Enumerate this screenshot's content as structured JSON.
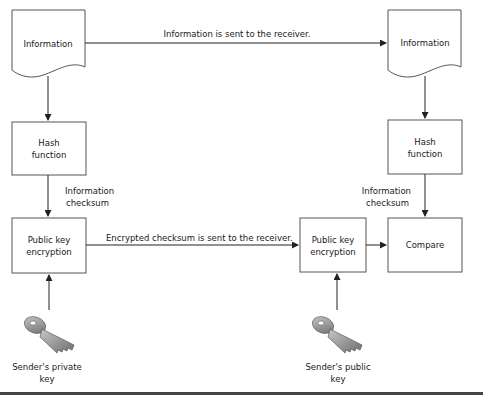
{
  "diagram": {
    "nodes": {
      "info_left": "Information",
      "info_right": "Information",
      "hash_left": [
        "Hash",
        "function"
      ],
      "hash_right": [
        "Hash",
        "function"
      ],
      "pk_left": [
        "Public key",
        "encryption"
      ],
      "pk_right": [
        "Public key",
        "encryption"
      ],
      "compare": "Compare"
    },
    "edges": {
      "info_sent": "Information is sent to the receiver.",
      "checksum_sent": "Encrypted checksum is sent to the receiver.",
      "checksum_left": [
        "Information",
        "checksum"
      ],
      "checksum_right": [
        "Information",
        "checksum"
      ]
    },
    "keys": {
      "private": [
        "Sender's private",
        "key"
      ],
      "public": [
        "Sender's public",
        "key"
      ]
    },
    "colors": {
      "line": "#222222",
      "box_border": "#555555",
      "key_fill": "#9a9a9a"
    }
  }
}
